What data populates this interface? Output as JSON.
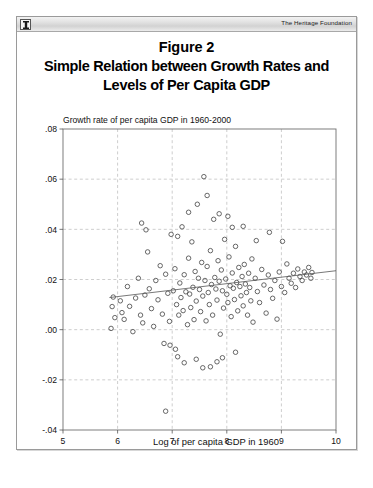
{
  "header": {
    "brand": "The Heritage Foundation",
    "logo_icon": "heritage-column-logo-icon"
  },
  "figure": {
    "title_line_1": "Figure 2",
    "title_line_2": "Simple Relation between Growth Rates and",
    "title_line_3": "Levels of Per Capita GDP"
  },
  "chart_data": {
    "type": "scatter",
    "title": "Simple Relation between Growth Rates and Levels of Per Capita GDP",
    "subtitle": "Figure 2",
    "xlabel": "Log of per capita GDP in 1960",
    "ylabel": "",
    "y_caption": "Growth rate of per capita GDP in 1960-2000",
    "xlim": [
      5,
      10
    ],
    "ylim": [
      -0.04,
      0.08
    ],
    "xticks": [
      5,
      6,
      7,
      8,
      9,
      10
    ],
    "xtick_labels": [
      "5",
      "6",
      "7",
      "8",
      "9",
      "10"
    ],
    "yticks": [
      -0.04,
      -0.02,
      0.0,
      0.02,
      0.04,
      0.06,
      0.08
    ],
    "ytick_labels": [
      "-.04",
      "-.02",
      ".00",
      ".02",
      ".04",
      ".06",
      ".08"
    ],
    "grid": true,
    "grid_style": "dashed",
    "legend": null,
    "marker": "open-circle",
    "marker_color": "#4d4d4d",
    "fit_line": {
      "name": "linear fit",
      "x": [
        5.85,
        10.0
      ],
      "y": [
        0.0128,
        0.0235
      ],
      "color": "#555555"
    },
    "points": [
      [
        5.92,
        0.013
      ],
      [
        5.9,
        0.0092
      ],
      [
        5.95,
        0.0048
      ],
      [
        5.88,
        0.0005
      ],
      [
        6.05,
        0.0115
      ],
      [
        6.08,
        0.0068
      ],
      [
        6.12,
        0.0041
      ],
      [
        6.18,
        0.0172
      ],
      [
        6.22,
        0.0093
      ],
      [
        6.28,
        -0.0008
      ],
      [
        6.33,
        0.0126
      ],
      [
        6.38,
        0.0205
      ],
      [
        6.42,
        0.0058
      ],
      [
        6.46,
        0.0027
      ],
      [
        6.5,
        0.0138
      ],
      [
        6.55,
        0.031
      ],
      [
        6.58,
        0.0163
      ],
      [
        6.62,
        0.0084
      ],
      [
        6.66,
        0.0013
      ],
      [
        6.7,
        0.0196
      ],
      [
        6.74,
        0.0119
      ],
      [
        6.78,
        0.0255
      ],
      [
        6.82,
        0.0062
      ],
      [
        6.85,
        -0.0055
      ],
      [
        6.88,
        0.0221
      ],
      [
        6.92,
        0.0145
      ],
      [
        6.95,
        0.0033
      ],
      [
        6.98,
        0.038
      ],
      [
        6.88,
        -0.0325
      ],
      [
        7.02,
        0.0155
      ],
      [
        7.05,
        0.0243
      ],
      [
        7.08,
        0.01
      ],
      [
        7.1,
        0.0372
      ],
      [
        7.12,
        0.0058
      ],
      [
        7.14,
        0.0186
      ],
      [
        7.16,
        0.0128
      ],
      [
        7.18,
        0.041
      ],
      [
        7.2,
        0.0076
      ],
      [
        7.22,
        0.0219
      ],
      [
        7.25,
        0.0151
      ],
      [
        7.28,
        0.002
      ],
      [
        7.3,
        0.0285
      ],
      [
        7.32,
        0.0142
      ],
      [
        7.34,
        0.0088
      ],
      [
        7.36,
        0.035
      ],
      [
        7.38,
        0.0169
      ],
      [
        7.4,
        0.004
      ],
      [
        7.42,
        0.0232
      ],
      [
        7.44,
        0.0114
      ],
      [
        7.46,
        0.05
      ],
      [
        7.48,
        0.0205
      ],
      [
        7.5,
        0.016
      ],
      [
        7.52,
        0.0072
      ],
      [
        7.54,
        0.0268
      ],
      [
        7.56,
        0.0134
      ],
      [
        7.58,
        0.061
      ],
      [
        7.6,
        0.0196
      ],
      [
        7.62,
        0.0035
      ],
      [
        7.64,
        0.0252
      ],
      [
        7.66,
        0.0148
      ],
      [
        7.68,
        0.01
      ],
      [
        7.7,
        0.0315
      ],
      [
        7.72,
        0.018
      ],
      [
        7.74,
        0.0058
      ],
      [
        7.76,
        0.044
      ],
      [
        7.78,
        0.0208
      ],
      [
        7.8,
        0.0162
      ],
      [
        7.82,
        0.0118
      ],
      [
        7.84,
        0.0275
      ],
      [
        7.86,
        0.0193
      ],
      [
        7.88,
        -0.0018
      ],
      [
        7.9,
        0.0238
      ],
      [
        7.92,
        0.0155
      ],
      [
        7.94,
        0.0086
      ],
      [
        7.96,
        0.036
      ],
      [
        7.98,
        0.0202
      ],
      [
        8.0,
        0.0141
      ],
      [
        8.02,
        0.0108
      ],
      [
        8.04,
        0.029
      ],
      [
        8.06,
        0.0175
      ],
      [
        8.08,
        0.0052
      ],
      [
        8.1,
        0.0226
      ],
      [
        8.12,
        0.0165
      ],
      [
        8.14,
        0.012
      ],
      [
        8.16,
        0.0332
      ],
      [
        8.18,
        0.0188
      ],
      [
        8.2,
        0.0075
      ],
      [
        8.22,
        0.0248
      ],
      [
        8.24,
        0.0172
      ],
      [
        8.26,
        0.0135
      ],
      [
        8.28,
        0.0212
      ],
      [
        8.3,
        0.0095
      ],
      [
        8.32,
        0.026
      ],
      [
        8.34,
        0.0182
      ],
      [
        8.36,
        0.0148
      ],
      [
        8.38,
        0.0058
      ],
      [
        8.4,
        0.0225
      ],
      [
        8.42,
        0.0168
      ],
      [
        8.44,
        0.0115
      ],
      [
        8.46,
        0.0282
      ],
      [
        8.48,
        0.003
      ],
      [
        8.52,
        0.0205
      ],
      [
        8.56,
        0.0152
      ],
      [
        8.6,
        0.0108
      ],
      [
        8.64,
        0.024
      ],
      [
        8.68,
        0.0178
      ],
      [
        8.72,
        0.0066
      ],
      [
        8.76,
        0.0218
      ],
      [
        8.8,
        0.016
      ],
      [
        8.84,
        0.0125
      ],
      [
        8.88,
        0.0196
      ],
      [
        8.92,
        0.0042
      ],
      [
        8.96,
        0.023
      ],
      [
        9.0,
        0.0172
      ],
      [
        9.06,
        0.0148
      ],
      [
        9.1,
        0.0262
      ],
      [
        9.14,
        0.0205
      ],
      [
        9.18,
        0.0185
      ],
      [
        9.22,
        0.0225
      ],
      [
        9.26,
        0.0168
      ],
      [
        9.3,
        0.0242
      ],
      [
        9.34,
        0.0212
      ],
      [
        9.38,
        0.0196
      ],
      [
        9.42,
        0.023
      ],
      [
        9.46,
        0.0218
      ],
      [
        9.5,
        0.0248
      ],
      [
        9.54,
        0.0205
      ],
      [
        9.56,
        0.0228
      ],
      [
        7.3,
        0.0468
      ],
      [
        7.64,
        0.0535
      ],
      [
        8.1,
        0.0408
      ],
      [
        8.3,
        0.0412
      ],
      [
        8.54,
        0.0355
      ],
      [
        8.78,
        0.0388
      ],
      [
        9.02,
        0.0352
      ],
      [
        6.44,
        0.0425
      ],
      [
        6.52,
        0.0398
      ],
      [
        7.86,
        0.0462
      ],
      [
        8.02,
        0.0452
      ],
      [
        7.1,
        -0.0108
      ],
      [
        7.22,
        -0.0132
      ],
      [
        7.44,
        -0.0118
      ],
      [
        7.56,
        -0.0152
      ],
      [
        7.7,
        -0.0148
      ],
      [
        7.82,
        -0.0128
      ],
      [
        7.92,
        -0.0112
      ],
      [
        8.16,
        -0.009
      ],
      [
        6.96,
        -0.0062
      ],
      [
        7.06,
        -0.0078
      ]
    ]
  }
}
